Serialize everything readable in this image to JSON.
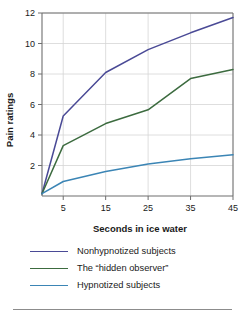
{
  "chart_data": {
    "type": "line",
    "title": "",
    "xlabel": "Seconds in ice water",
    "ylabel": "Pain ratings",
    "xlim": [
      0,
      45
    ],
    "ylim": [
      0,
      12
    ],
    "xticks": [
      5,
      15,
      25,
      35,
      45
    ],
    "yticks": [
      2,
      4,
      6,
      8,
      10,
      12
    ],
    "xtick_labels": [
      "5",
      "15",
      "25",
      "35",
      "45"
    ],
    "ytick_labels": [
      "2",
      "4",
      "6",
      "8",
      "10",
      "12"
    ],
    "grid": "both",
    "legend_position": "below",
    "x": [
      0,
      5,
      15,
      25,
      35,
      45
    ],
    "series": [
      {
        "name": "Nonhypnotized subjects",
        "color": "#4a4a96",
        "values": [
          0.15,
          5.25,
          8.1,
          9.6,
          10.7,
          11.7
        ]
      },
      {
        "name": "The “hidden observer”",
        "color": "#3c6b3f",
        "values": [
          0.15,
          3.3,
          4.75,
          5.65,
          7.7,
          8.3
        ]
      },
      {
        "name": "Hypnotized subjects",
        "color": "#3b85b5",
        "values": [
          0.15,
          0.95,
          1.6,
          2.1,
          2.45,
          2.7
        ]
      }
    ]
  },
  "axes": {
    "y_title": "Pain ratings",
    "x_title": "Seconds in ice water"
  },
  "legend": {
    "items": [
      {
        "label": "Nonhypnotized subjects",
        "color": "#4a4a96"
      },
      {
        "label": "The “hidden observer”",
        "color": "#3c6b3f"
      },
      {
        "label": "Hypnotized subjects",
        "color": "#3b85b5"
      }
    ]
  },
  "colors": {
    "axis": "#6e6e6e",
    "grid": "#d6d6d6",
    "text": "#1a1a1a",
    "rule": "#8c8c8c"
  }
}
